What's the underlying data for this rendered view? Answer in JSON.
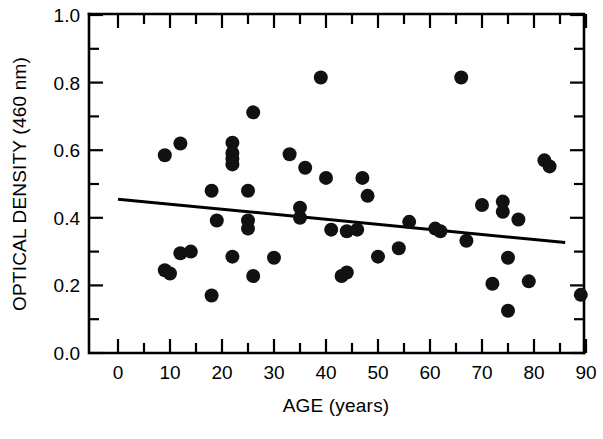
{
  "chart_data": {
    "type": "scatter",
    "title": "",
    "xlabel": "AGE  (years)",
    "ylabel": "OPTICAL DENSITY  (460 nm)",
    "xlim": [
      0,
      95
    ],
    "ylim": [
      0.0,
      1.0
    ],
    "grid": false,
    "legend": null,
    "x_major_ticks": [
      0,
      10,
      20,
      30,
      40,
      50,
      60,
      70,
      80,
      90
    ],
    "x_tick_labels": [
      "0",
      "10",
      "20",
      "30",
      "40",
      "50",
      "60",
      "70",
      "80",
      "90"
    ],
    "x_minor_step": 5,
    "y_major_ticks": [
      0.0,
      0.2,
      0.4,
      0.6,
      0.8,
      1.0
    ],
    "y_tick_labels": [
      "0.0",
      "0.2",
      "0.4",
      "0.6",
      "0.8",
      "1.0"
    ],
    "y_minor_step": 0.1,
    "marker": "filled-circle",
    "marker_color": "#111111",
    "marker_radius_px": 7,
    "points": [
      {
        "x": 9,
        "y": 0.585
      },
      {
        "x": 9,
        "y": 0.245
      },
      {
        "x": 10,
        "y": 0.235
      },
      {
        "x": 12,
        "y": 0.62
      },
      {
        "x": 12,
        "y": 0.295
      },
      {
        "x": 14,
        "y": 0.3
      },
      {
        "x": 18,
        "y": 0.48
      },
      {
        "x": 18,
        "y": 0.17
      },
      {
        "x": 19,
        "y": 0.392
      },
      {
        "x": 22,
        "y": 0.622
      },
      {
        "x": 22,
        "y": 0.575
      },
      {
        "x": 22,
        "y": 0.592
      },
      {
        "x": 22,
        "y": 0.558
      },
      {
        "x": 22,
        "y": 0.285
      },
      {
        "x": 25,
        "y": 0.48
      },
      {
        "x": 25,
        "y": 0.392
      },
      {
        "x": 25,
        "y": 0.368
      },
      {
        "x": 26,
        "y": 0.712
      },
      {
        "x": 26,
        "y": 0.228
      },
      {
        "x": 30,
        "y": 0.282
      },
      {
        "x": 33,
        "y": 0.588
      },
      {
        "x": 35,
        "y": 0.43
      },
      {
        "x": 35,
        "y": 0.4
      },
      {
        "x": 36,
        "y": 0.548
      },
      {
        "x": 39,
        "y": 0.815
      },
      {
        "x": 40,
        "y": 0.518
      },
      {
        "x": 41,
        "y": 0.365
      },
      {
        "x": 43,
        "y": 0.228
      },
      {
        "x": 44,
        "y": 0.36
      },
      {
        "x": 44,
        "y": 0.238
      },
      {
        "x": 46,
        "y": 0.365
      },
      {
        "x": 47,
        "y": 0.518
      },
      {
        "x": 48,
        "y": 0.465
      },
      {
        "x": 50,
        "y": 0.285
      },
      {
        "x": 54,
        "y": 0.31
      },
      {
        "x": 56,
        "y": 0.388
      },
      {
        "x": 61,
        "y": 0.368
      },
      {
        "x": 62,
        "y": 0.36
      },
      {
        "x": 66,
        "y": 0.815
      },
      {
        "x": 67,
        "y": 0.332
      },
      {
        "x": 70,
        "y": 0.438
      },
      {
        "x": 72,
        "y": 0.205
      },
      {
        "x": 74,
        "y": 0.448
      },
      {
        "x": 74,
        "y": 0.418
      },
      {
        "x": 75,
        "y": 0.282
      },
      {
        "x": 75,
        "y": 0.125
      },
      {
        "x": 77,
        "y": 0.395
      },
      {
        "x": 79,
        "y": 0.212
      },
      {
        "x": 82,
        "y": 0.57
      },
      {
        "x": 83,
        "y": 0.552
      },
      {
        "x": 89,
        "y": 0.172
      }
    ],
    "fit_line": {
      "type": "linear-regression",
      "x_start": 0,
      "y_start": 0.455,
      "x_end": 86,
      "y_end": 0.327
    }
  }
}
